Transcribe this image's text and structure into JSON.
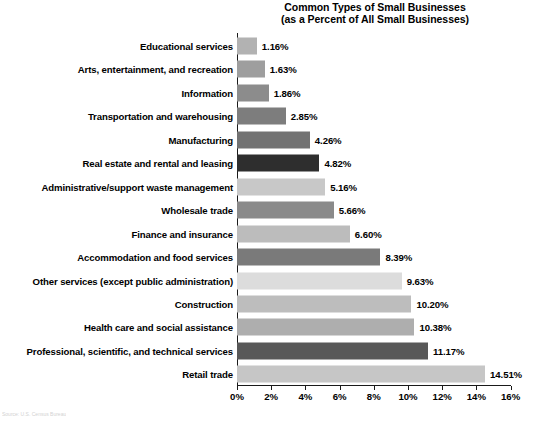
{
  "chart_data": {
    "type": "bar",
    "orientation": "horizontal",
    "title": "Common Types of Small Businesses",
    "subtitle": "(as a Percent of All Small Businesses)",
    "xlabel": "",
    "ylabel": "",
    "xlim": [
      0,
      16
    ],
    "grid": false,
    "legend": null,
    "xticks": [
      "0%",
      "2%",
      "4%",
      "6%",
      "8%",
      "10%",
      "12%",
      "14%",
      "16%"
    ],
    "xtick_values": [
      0,
      2,
      4,
      6,
      8,
      10,
      12,
      14,
      16
    ],
    "categories": [
      "Educational services",
      "Arts, entertainment, and recreation",
      "Information",
      "Transportation and warehousing",
      "Manufacturing",
      "Real estate and rental and leasing",
      "Administrative/support waste management",
      "Wholesale trade",
      "Finance and insurance",
      "Accommodation and food services",
      "Other services (except public administration)",
      "Construction",
      "Health care and social assistance",
      "Professional, scientific, and technical services",
      "Retail trade"
    ],
    "values": [
      1.16,
      1.63,
      1.86,
      2.85,
      4.26,
      4.82,
      5.16,
      5.66,
      6.6,
      8.39,
      9.63,
      10.2,
      10.38,
      11.17,
      14.51
    ],
    "data_labels": [
      "1.16%",
      "1.63%",
      "1.86%",
      "2.85%",
      "4.26%",
      "4.82%",
      "5.16%",
      "5.66%",
      "6.60%",
      "8.39%",
      "9.63%",
      "10.20%",
      "10.38%",
      "11.17%",
      "14.51%"
    ],
    "bar_colors": [
      "#b2b2b2",
      "#9e9e9e",
      "#8c8c8c",
      "#7d7d7d",
      "#727272",
      "#2e2e2e",
      "#c8c8c8",
      "#8a8a8a",
      "#bcbcbc",
      "#7a7a7a",
      "#dcdcdc",
      "#bdbdbd",
      "#aeaeae",
      "#585858",
      "#c6c6c6"
    ],
    "axis_color": "#1a1a1a",
    "background": "#ffffff"
  },
  "footer": {
    "source_note": "Source: U.S. Census Bureau"
  }
}
